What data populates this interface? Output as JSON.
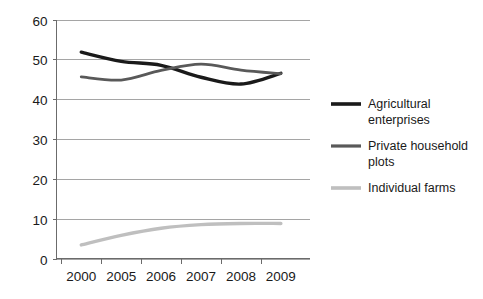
{
  "chart_data": {
    "type": "line",
    "title": "",
    "subtitle": "",
    "xlabel": "",
    "ylabel": "",
    "categories": [
      "2000",
      "2005",
      "2006",
      "2007",
      "2008",
      "2009"
    ],
    "x": [
      "2000",
      "2005",
      "2006",
      "2007",
      "2008",
      "2009"
    ],
    "ylim": [
      0,
      60
    ],
    "yticks": [
      0,
      10,
      20,
      30,
      40,
      50,
      60
    ],
    "ytick_labels": [
      "0",
      "10",
      "20",
      "30",
      "40",
      "50",
      "60"
    ],
    "grid": true,
    "grid_axis": "y",
    "legend_position": "right",
    "series": [
      {
        "name": "Agricultural enterprises",
        "color": "#1a1a1a",
        "values": [
          51.8,
          49.5,
          48.5,
          45.5,
          43.8,
          46.5
        ]
      },
      {
        "name": "Private household plots",
        "color": "#595959",
        "values": [
          45.6,
          44.8,
          47.2,
          48.8,
          47.3,
          46.4
        ]
      },
      {
        "name": "Individual farms",
        "color": "#bfbfbf",
        "values": [
          3.4,
          5.8,
          7.6,
          8.5,
          8.8,
          8.8
        ]
      }
    ]
  },
  "legend": {
    "items": [
      {
        "label": "Agricultural enterprises",
        "color": "#1a1a1a"
      },
      {
        "label": "Private household plots",
        "color": "#595959"
      },
      {
        "label": "Individual farms",
        "color": "#bfbfbf"
      }
    ]
  },
  "axes": {
    "y": {
      "labels": [
        "60",
        "50",
        "40",
        "30",
        "20",
        "10",
        "0"
      ]
    },
    "x": {
      "labels": [
        "2000",
        "2005",
        "2006",
        "2007",
        "2008",
        "2009"
      ]
    }
  },
  "colors": {
    "series_1": "#1a1a1a",
    "series_2": "#595959",
    "series_3": "#bfbfbf",
    "gridline": "#9b9b9b",
    "axis": "#6b6b6b",
    "background": "#ffffff",
    "text": "#1a1a1a"
  }
}
